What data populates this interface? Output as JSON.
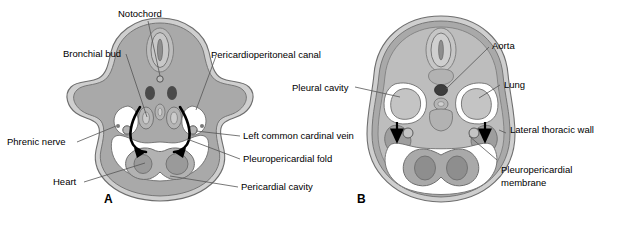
{
  "figure": {
    "type": "anatomical-diagram",
    "background_color": "#ffffff"
  },
  "panels": [
    {
      "id": "A",
      "letter": "A",
      "description": "Earlier stage transverse section showing pericardioperitoneal canals and pleuropericardial folds"
    },
    {
      "id": "B",
      "letter": "B",
      "description": "Later stage transverse section showing pleuropericardial membranes fusing, lungs and pleural cavities"
    }
  ],
  "labels_panel_a": [
    {
      "id": "notochord",
      "text": "Notochord"
    },
    {
      "id": "bronchial-bud",
      "text": "Bronchial bud"
    },
    {
      "id": "phrenic-nerve",
      "text": "Phrenic nerve"
    },
    {
      "id": "heart",
      "text": "Heart"
    },
    {
      "id": "pericardioperitoneal-canal",
      "text": "Pericardioperitoneal canal"
    },
    {
      "id": "left-common-cardinal-vein",
      "text": "Left common cardinal vein"
    },
    {
      "id": "pleuropericardial-fold",
      "text": "Pleuropericardial fold"
    },
    {
      "id": "pericardial-cavity",
      "text": "Pericardial cavity"
    }
  ],
  "labels_panel_b": [
    {
      "id": "pleural-cavity",
      "text": "Pleural cavity"
    },
    {
      "id": "aorta",
      "text": "Aorta"
    },
    {
      "id": "lung",
      "text": "Lung"
    },
    {
      "id": "lateral-thoracic-wall",
      "text": "Lateral thoracic wall"
    },
    {
      "id": "pleuropericardial-membrane-line1",
      "text": "Pleuropericardial"
    },
    {
      "id": "pleuropericardial-membrane-line2",
      "text": "membrane"
    }
  ],
  "colors": {
    "body_fill": "#a9a9a9",
    "outer_rim_light": "#cfcfcf",
    "outline_dark": "#6e6e6e",
    "cavity_white": "#ffffff",
    "organ_mid": "#b9b9b9",
    "organ_dark": "#8e8e8e",
    "vessel_dark": "#3d3d3d",
    "black": "#000000",
    "leader_line": "#555555"
  }
}
